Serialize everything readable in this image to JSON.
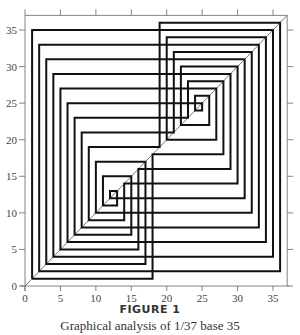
{
  "figure": {
    "title": "FIGURE 1",
    "caption": "Graphical analysis of 1/37 base 35"
  },
  "chart_data": {
    "type": "line",
    "subtype": "cobweb",
    "title": "FIGURE 1",
    "subtitle": "Graphical analysis of 1/37 base 35",
    "xlabel": "",
    "ylabel": "",
    "xlim": [
      0,
      37
    ],
    "ylim": [
      0,
      37
    ],
    "x_ticks": [
      0,
      5,
      10,
      15,
      20,
      25,
      30,
      35
    ],
    "y_ticks": [
      0,
      5,
      10,
      15,
      20,
      25,
      30,
      35
    ],
    "x_tick_labels": [
      "0",
      "5",
      "10",
      "15",
      "20",
      "25",
      "30",
      "35"
    ],
    "y_tick_labels": [
      "0",
      "5",
      "10",
      "15",
      "20",
      "25",
      "30",
      "35"
    ],
    "grid": false,
    "legend": null,
    "map": "x -> 35x mod 37",
    "diagonal": {
      "from": [
        0,
        0
      ],
      "to": [
        37,
        37
      ]
    },
    "orbit": [
      1,
      35,
      4,
      29,
      16,
      5,
      27,
      20,
      34,
      6,
      25,
      24,
      26,
      22,
      30,
      14,
      9,
      19,
      36,
      2,
      33,
      8,
      21,
      32,
      10,
      17,
      3,
      31,
      12,
      13,
      11,
      15,
      7,
      23,
      28,
      18,
      1
    ],
    "series": [
      {
        "name": "cobweb path",
        "description": "vertical from (x_n,x_n) to (x_n,x_{n+1}), then horizontal to (x_{n+1},x_{n+1})"
      }
    ]
  },
  "style": {
    "line_color": "#111111",
    "axis_color": "#777777",
    "diagonal_color": "#666666"
  }
}
